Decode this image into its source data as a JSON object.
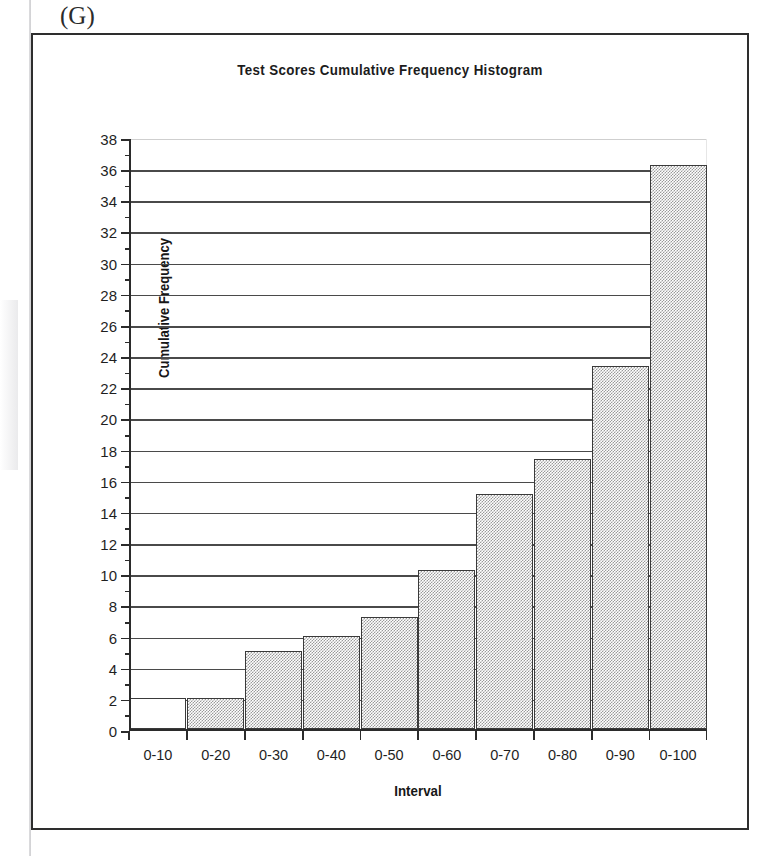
{
  "figure_label": "(G)",
  "chart_data": {
    "type": "bar",
    "title": "Test Scores Cumulative Frequency Histogram",
    "xlabel": "Interval",
    "ylabel": "Cumulative Frequency",
    "categories": [
      "0-10",
      "0-20",
      "0-30",
      "0-40",
      "0-50",
      "0-60",
      "0-70",
      "0-80",
      "0-90",
      "0-100"
    ],
    "values": [
      2,
      2,
      5,
      6,
      7.2,
      10.2,
      15.1,
      17.3,
      23.3,
      36.2
    ],
    "bar_filled": [
      false,
      true,
      true,
      true,
      true,
      true,
      true,
      true,
      true,
      true
    ],
    "ylim": [
      0,
      38
    ],
    "ytick_step": 2,
    "ytick_labels": [
      "0",
      "2",
      "4",
      "6",
      "8",
      "10",
      "12",
      "14",
      "16",
      "18",
      "20",
      "22",
      "24",
      "26",
      "28",
      "30",
      "32",
      "34",
      "36",
      "38"
    ],
    "grid": true,
    "legend": "none",
    "bar_fill_color": "#9a9a9a",
    "bar_border_color": "#3a3a3a",
    "gridline_color": "#4a4a4a",
    "axis_color": "#2b2b2b"
  }
}
